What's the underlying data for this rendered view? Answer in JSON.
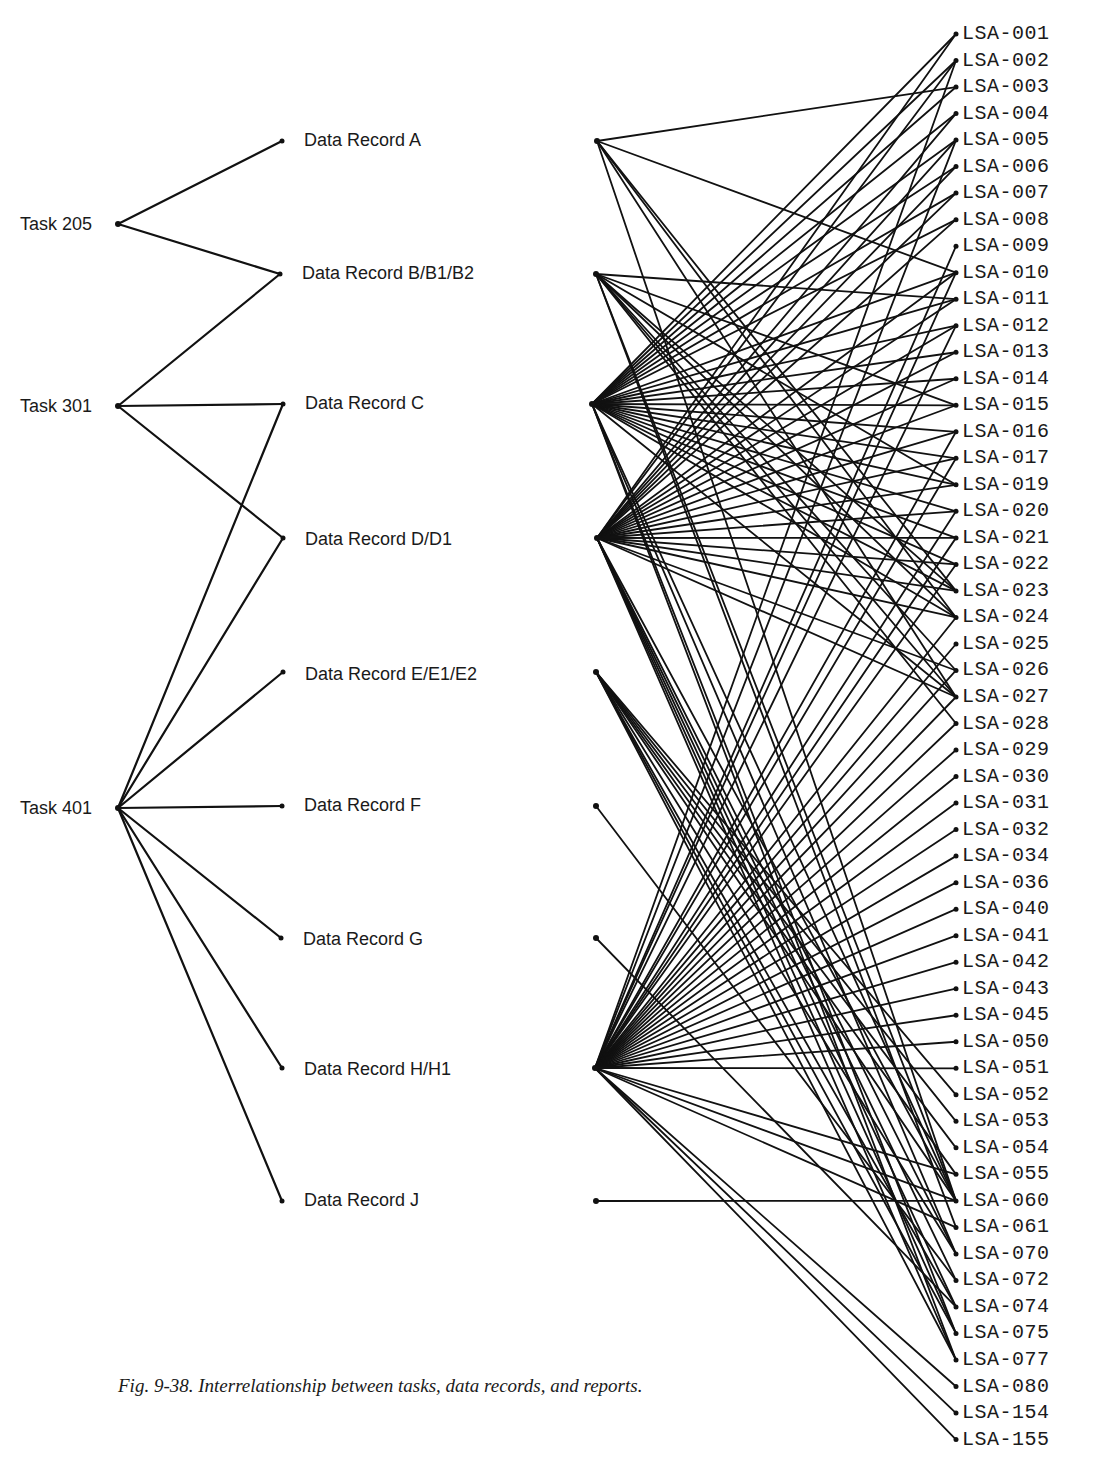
{
  "caption": "Fig. 9-38. Interrelationship between tasks, data records, and reports.",
  "colors": {
    "ink": "#111111",
    "background": "#ffffff"
  },
  "tasks": [
    {
      "id": "T205",
      "label": "Task 205",
      "x": 118,
      "y": 224
    },
    {
      "id": "T301",
      "label": "Task 301",
      "x": 118,
      "y": 406
    },
    {
      "id": "T401",
      "label": "Task 401",
      "x": 118,
      "y": 808
    }
  ],
  "records": [
    {
      "id": "A",
      "label": "Data Record A",
      "lx": 282,
      "rx": 597,
      "y": 141,
      "ly": 141
    },
    {
      "id": "B",
      "label": "Data Record B/B1/B2",
      "lx": 280,
      "rx": 596,
      "y": 274,
      "ly": 274
    },
    {
      "id": "C",
      "label": "Data Record C",
      "lx": 283,
      "rx": 592,
      "y": 404,
      "ly": 404
    },
    {
      "id": "D",
      "label": "Data Record D/D1",
      "lx": 283,
      "rx": 597,
      "y": 538,
      "ly": 540
    },
    {
      "id": "E",
      "label": "Data Record E/E1/E2",
      "lx": 283,
      "rx": 596,
      "y": 672,
      "ly": 675
    },
    {
      "id": "F",
      "label": "Data Record F",
      "lx": 282,
      "rx": 596,
      "y": 806,
      "ly": 806
    },
    {
      "id": "G",
      "label": "Data Record G",
      "lx": 281,
      "rx": 596,
      "y": 938,
      "ly": 940
    },
    {
      "id": "H",
      "label": "Data Record H/H1",
      "lx": 282,
      "rx": 595,
      "y": 1068,
      "ly": 1070
    },
    {
      "id": "J",
      "label": "Data Record J",
      "lx": 282,
      "rx": 596,
      "y": 1201,
      "ly": 1201
    }
  ],
  "task_record_links": [
    [
      "T205",
      "A"
    ],
    [
      "T205",
      "B"
    ],
    [
      "T301",
      "B"
    ],
    [
      "T301",
      "C"
    ],
    [
      "T301",
      "D"
    ],
    [
      "T401",
      "C"
    ],
    [
      "T401",
      "D"
    ],
    [
      "T401",
      "E"
    ],
    [
      "T401",
      "F"
    ],
    [
      "T401",
      "G"
    ],
    [
      "T401",
      "H"
    ],
    [
      "T401",
      "J"
    ]
  ],
  "lsa": {
    "x_dot": 956,
    "x_label": 962,
    "y_start": 34,
    "spacing": 26.52,
    "items": [
      "LSA-001",
      "LSA-002",
      "LSA-003",
      "LSA-004",
      "LSA-005",
      "LSA-006",
      "LSA-007",
      "LSA-008",
      "LSA-009",
      "LSA-010",
      "LSA-011",
      "LSA-012",
      "LSA-013",
      "LSA-014",
      "LSA-015",
      "LSA-016",
      "LSA-017",
      "LSA-019",
      "LSA-020",
      "LSA-021",
      "LSA-022",
      "LSA-023",
      "LSA-024",
      "LSA-025",
      "LSA-026",
      "LSA-027",
      "LSA-028",
      "LSA-029",
      "LSA-030",
      "LSA-031",
      "LSA-032",
      "LSA-034",
      "LSA-036",
      "LSA-040",
      "LSA-041",
      "LSA-042",
      "LSA-043",
      "LSA-045",
      "LSA-050",
      "LSA-051",
      "LSA-052",
      "LSA-053",
      "LSA-054",
      "LSA-055",
      "LSA-060",
      "LSA-061",
      "LSA-070",
      "LSA-072",
      "LSA-074",
      "LSA-075",
      "LSA-077",
      "LSA-080",
      "LSA-154",
      "LSA-155"
    ]
  },
  "record_lsa_links": {
    "A": [
      "LSA-003",
      "LSA-010",
      "LSA-027",
      "LSA-023",
      "LSA-024",
      "LSA-060"
    ],
    "B": [
      "LSA-011",
      "LSA-015",
      "LSA-019",
      "LSA-023",
      "LSA-024",
      "LSA-026",
      "LSA-027",
      "LSA-028",
      "LSA-060",
      "LSA-061"
    ],
    "C": [
      "LSA-001",
      "LSA-002",
      "LSA-003",
      "LSA-004",
      "LSA-005",
      "LSA-006",
      "LSA-007",
      "LSA-008",
      "LSA-010",
      "LSA-011",
      "LSA-012",
      "LSA-013",
      "LSA-014",
      "LSA-015",
      "LSA-016",
      "LSA-017",
      "LSA-019",
      "LSA-020",
      "LSA-021",
      "LSA-022",
      "LSA-023",
      "LSA-024",
      "LSA-027",
      "LSA-060",
      "LSA-070",
      "LSA-075",
      "LSA-077"
    ],
    "D": [
      "LSA-001",
      "LSA-002",
      "LSA-004",
      "LSA-005",
      "LSA-006",
      "LSA-007",
      "LSA-008",
      "LSA-010",
      "LSA-011",
      "LSA-012",
      "LSA-013",
      "LSA-014",
      "LSA-015",
      "LSA-016",
      "LSA-017",
      "LSA-019",
      "LSA-020",
      "LSA-021",
      "LSA-022",
      "LSA-023",
      "LSA-024",
      "LSA-026",
      "LSA-027",
      "LSA-060",
      "LSA-070",
      "LSA-072",
      "LSA-074",
      "LSA-075",
      "LSA-077"
    ],
    "E": [
      "LSA-052",
      "LSA-053",
      "LSA-054",
      "LSA-055",
      "LSA-060",
      "LSA-070",
      "LSA-074",
      "LSA-075",
      "LSA-077"
    ],
    "F": [
      "LSA-072"
    ],
    "G": [
      "LSA-074"
    ],
    "H": [
      "LSA-002",
      "LSA-005",
      "LSA-009",
      "LSA-010",
      "LSA-012",
      "LSA-016",
      "LSA-017",
      "LSA-020",
      "LSA-021",
      "LSA-022",
      "LSA-024",
      "LSA-025",
      "LSA-026",
      "LSA-027",
      "LSA-028",
      "LSA-029",
      "LSA-030",
      "LSA-031",
      "LSA-032",
      "LSA-034",
      "LSA-036",
      "LSA-040",
      "LSA-041",
      "LSA-042",
      "LSA-043",
      "LSA-045",
      "LSA-050",
      "LSA-051",
      "LSA-055",
      "LSA-060",
      "LSA-061",
      "LSA-080",
      "LSA-154",
      "LSA-155"
    ],
    "J": [
      "LSA-060"
    ]
  }
}
